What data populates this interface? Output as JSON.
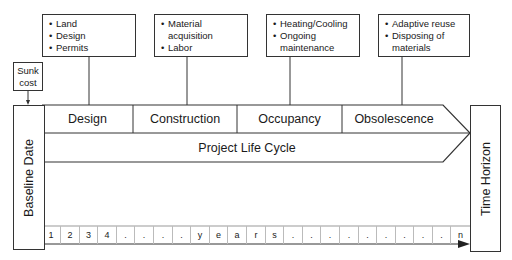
{
  "notes": [
    {
      "items": [
        "Land",
        "Design",
        "Permits"
      ]
    },
    {
      "items": [
        "Material acquisition",
        "Labor"
      ]
    },
    {
      "items": [
        "Heating/Cooling",
        "Ongoing maintenance"
      ]
    },
    {
      "items": [
        "Adaptive reuse",
        "Disposing of materials"
      ]
    }
  ],
  "sunk_cost": {
    "label": "Sunk cost"
  },
  "baseline": {
    "label": "Baseline Date"
  },
  "time_horizon": {
    "label": "Time Horizon"
  },
  "phases": [
    {
      "label": "Design"
    },
    {
      "label": "Construction"
    },
    {
      "label": "Occupancy"
    },
    {
      "label": "Obsolescence"
    }
  ],
  "life_cycle": {
    "label": "Project Life Cycle"
  },
  "timeline": {
    "cells": [
      "1",
      "2",
      "3",
      "4",
      ".",
      ".",
      ".",
      ".",
      "y",
      "e",
      "a",
      "r",
      "s",
      ".",
      ".",
      ".",
      ".",
      ".",
      ".",
      ".",
      ".",
      ".",
      "n"
    ]
  }
}
